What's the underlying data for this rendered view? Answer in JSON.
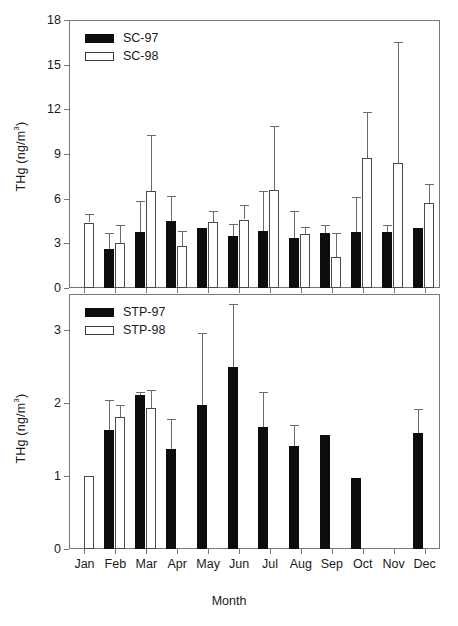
{
  "figure": {
    "xlabel": "Month",
    "ylabel_text": "THg (ng/m",
    "ylabel_sup": "3",
    "ylabel_tail": ")"
  },
  "top_panel": {
    "legend": [
      {
        "key": "sc97",
        "label": "SC-97",
        "style": "filled"
      },
      {
        "key": "sc98",
        "label": "SC-98",
        "style": "open"
      }
    ],
    "y_ticks": [
      "0",
      "3",
      "6",
      "9",
      "12",
      "15",
      "18"
    ]
  },
  "bottom_panel": {
    "legend": [
      {
        "key": "stp97",
        "label": "STP-97",
        "style": "filled"
      },
      {
        "key": "stp98",
        "label": "STP-98",
        "style": "open"
      }
    ],
    "y_ticks": [
      "0",
      "1",
      "2",
      "3"
    ]
  },
  "x_categories": [
    "Jan",
    "Feb",
    "Mar",
    "Apr",
    "May",
    "Jun",
    "Jul",
    "Aug",
    "Sep",
    "Oct",
    "Nov",
    "Dec"
  ],
  "chart_data": [
    {
      "id": "sc-panel",
      "type": "bar",
      "title": "",
      "xlabel": "Month",
      "ylabel": "THg (ng/m3)",
      "ylim": [
        0,
        18
      ],
      "ytick_values": [
        0,
        3,
        6,
        9,
        12,
        15,
        18
      ],
      "grid": false,
      "legend_position": "upper-left",
      "error_bars": "upper only (1 SD)",
      "categories": [
        "Jan",
        "Feb",
        "Mar",
        "Apr",
        "May",
        "Jun",
        "Jul",
        "Aug",
        "Sep",
        "Oct",
        "Nov",
        "Dec"
      ],
      "series": [
        {
          "name": "SC-97",
          "color": "#0d0d0d",
          "values": [
            null,
            2.65,
            3.75,
            4.5,
            4.0,
            3.5,
            3.8,
            3.35,
            3.7,
            3.75,
            3.75,
            4.05
          ],
          "error_upper": [
            null,
            3.7,
            5.85,
            6.2,
            null,
            4.3,
            6.5,
            5.2,
            4.2,
            6.1,
            4.2,
            null
          ]
        },
        {
          "name": "SC-98",
          "color": "#ffffff",
          "values": [
            4.4,
            3.0,
            6.5,
            2.8,
            4.45,
            4.6,
            6.55,
            3.6,
            2.1,
            8.7,
            8.4,
            5.7
          ],
          "error_upper": [
            4.95,
            4.25,
            10.3,
            3.8,
            5.15,
            5.6,
            10.9,
            4.1,
            3.7,
            11.8,
            16.5,
            7.0
          ]
        }
      ]
    },
    {
      "id": "stp-panel",
      "type": "bar",
      "title": "",
      "xlabel": "Month",
      "ylabel": "THg (ng/m3)",
      "ylim": [
        0,
        3.5
      ],
      "ytick_values": [
        0,
        1,
        2,
        3
      ],
      "grid": false,
      "legend_position": "upper-left",
      "error_bars": "upper only (1 SD)",
      "categories": [
        "Jan",
        "Feb",
        "Mar",
        "Apr",
        "May",
        "Jun",
        "Jul",
        "Aug",
        "Sep",
        "Oct",
        "Nov",
        "Dec"
      ],
      "series": [
        {
          "name": "STP-97",
          "color": "#0d0d0d",
          "values": [
            null,
            1.63,
            2.11,
            1.37,
            1.97,
            2.5,
            1.67,
            1.42,
            1.56,
            0.97,
            null,
            1.59
          ],
          "error_upper": [
            null,
            2.05,
            2.15,
            1.78,
            2.97,
            3.36,
            2.15,
            1.7,
            null,
            null,
            null,
            1.92
          ]
        },
        {
          "name": "STP-98",
          "color": "#ffffff",
          "values": [
            1.0,
            1.81,
            1.93,
            null,
            null,
            null,
            null,
            null,
            null,
            null,
            null,
            null
          ],
          "error_upper": [
            null,
            1.97,
            2.18,
            null,
            null,
            null,
            null,
            null,
            null,
            null,
            null,
            null
          ]
        }
      ]
    }
  ]
}
